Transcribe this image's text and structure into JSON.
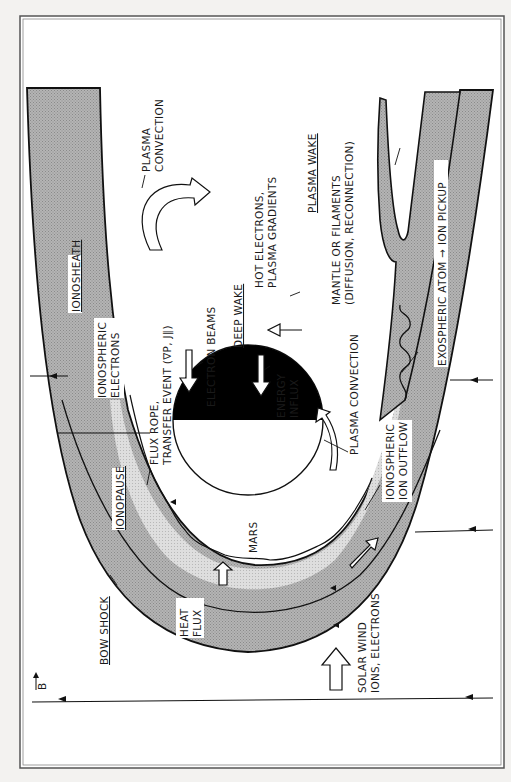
{
  "figure": {
    "orientation": "rotated 90 degrees clockwise (solar wind flows upward on page)",
    "colors": {
      "background": "#f3f2f0",
      "frame": "#555555",
      "sheath_fill": "#a9a9a9",
      "ionosphere_fill": "#d6d6d6",
      "planet_night": "#000000",
      "planet_day": "#ffffff",
      "line": "#111111"
    }
  },
  "labels": {
    "plasma_convection_top": [
      "PLASMA",
      "CONVECTION"
    ],
    "ionosheath": "IONOSHEATH",
    "ionospheric_electrons": [
      "IONOSPHERIC",
      "ELECTRONS"
    ],
    "flux_rope": [
      "FLUX ROPE,",
      "TRANSFER EVENT (∇P, J∥)"
    ],
    "electron_beams": "ELECTRON BEAMS",
    "deep_wake": "DEEP WAKE",
    "hot_electrons": [
      "HOT ELECTRONS,",
      "PLASMA GRADIENTS"
    ],
    "plasma_wake": "PLASMA WAKE",
    "mantle": [
      "MANTLE OR FILAMENTS",
      "(DIFFUSION,  RECONNECTION)"
    ],
    "exospheric_pickup": "EXOSPHERIC ATOM → ION PICKUP",
    "energy_influx": [
      "ENERGY",
      "INFLUX"
    ],
    "plasma_convection_bottom": "PLASMA CONVECTION",
    "ionospheric_outflow": [
      "IONOSPHERIC",
      "ION OUTFLOW"
    ],
    "ionopause": "IONOPAUSE",
    "mars": "MARS",
    "bow_shock": "BOW SHOCK",
    "heat_flux": [
      "HEAT",
      "FLUX"
    ],
    "b_field": "B",
    "solar_wind": [
      "SOLAR WIND",
      "IONS, ELECTRONS"
    ]
  }
}
